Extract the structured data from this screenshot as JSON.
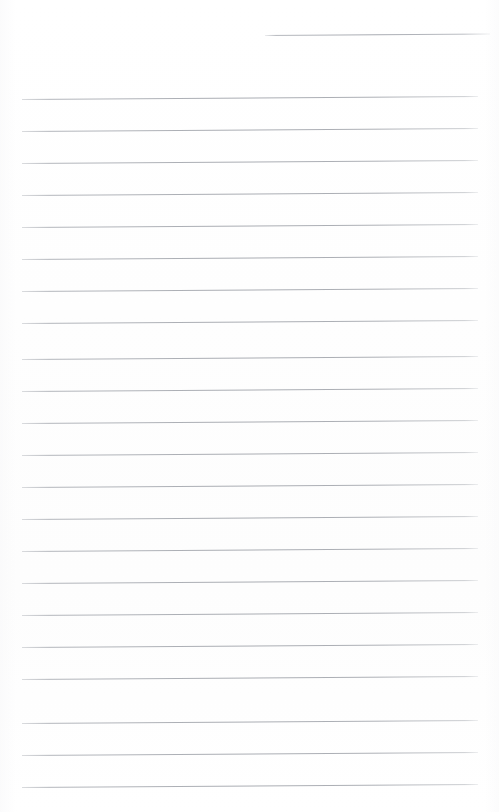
{
  "document": {
    "kind": "scanned-ruled-paper",
    "title": "Blank ruled page",
    "page_width": 499,
    "page_height": 812,
    "background_color": "#ffffff",
    "rule_color": "#aaadb3",
    "rule_thickness": 1,
    "rule_spacing": 32,
    "rule_slant_degrees": -0.38,
    "left_margin": 22,
    "right_margin": 21,
    "body_text": "",
    "has_handwriting": false,
    "has_header_text": false,
    "has_page_number": false,
    "partial_rule": {
      "label": "top-right short rule",
      "x_start": 265,
      "x_end": 490,
      "y": 35
    },
    "rules": [
      {
        "y": 99,
        "x_start": 22,
        "x_end": 478
      },
      {
        "y": 131,
        "x_start": 22,
        "x_end": 478
      },
      {
        "y": 163,
        "x_start": 22,
        "x_end": 478
      },
      {
        "y": 195,
        "x_start": 22,
        "x_end": 478
      },
      {
        "y": 227,
        "x_start": 22,
        "x_end": 478
      },
      {
        "y": 259,
        "x_start": 22,
        "x_end": 478
      },
      {
        "y": 291,
        "x_start": 22,
        "x_end": 478
      },
      {
        "y": 323,
        "x_start": 22,
        "x_end": 478
      },
      {
        "y": 359,
        "x_start": 22,
        "x_end": 478
      },
      {
        "y": 391,
        "x_start": 22,
        "x_end": 478
      },
      {
        "y": 423,
        "x_start": 22,
        "x_end": 478
      },
      {
        "y": 455,
        "x_start": 22,
        "x_end": 478
      },
      {
        "y": 487,
        "x_start": 22,
        "x_end": 478
      },
      {
        "y": 519,
        "x_start": 22,
        "x_end": 478
      },
      {
        "y": 551,
        "x_start": 22,
        "x_end": 478
      },
      {
        "y": 583,
        "x_start": 22,
        "x_end": 478
      },
      {
        "y": 615,
        "x_start": 22,
        "x_end": 478
      },
      {
        "y": 647,
        "x_start": 22,
        "x_end": 478
      },
      {
        "y": 679,
        "x_start": 22,
        "x_end": 478
      },
      {
        "y": 723,
        "x_start": 22,
        "x_end": 478
      },
      {
        "y": 755,
        "x_start": 22,
        "x_end": 478
      },
      {
        "y": 787,
        "x_start": 22,
        "x_end": 478
      }
    ]
  }
}
